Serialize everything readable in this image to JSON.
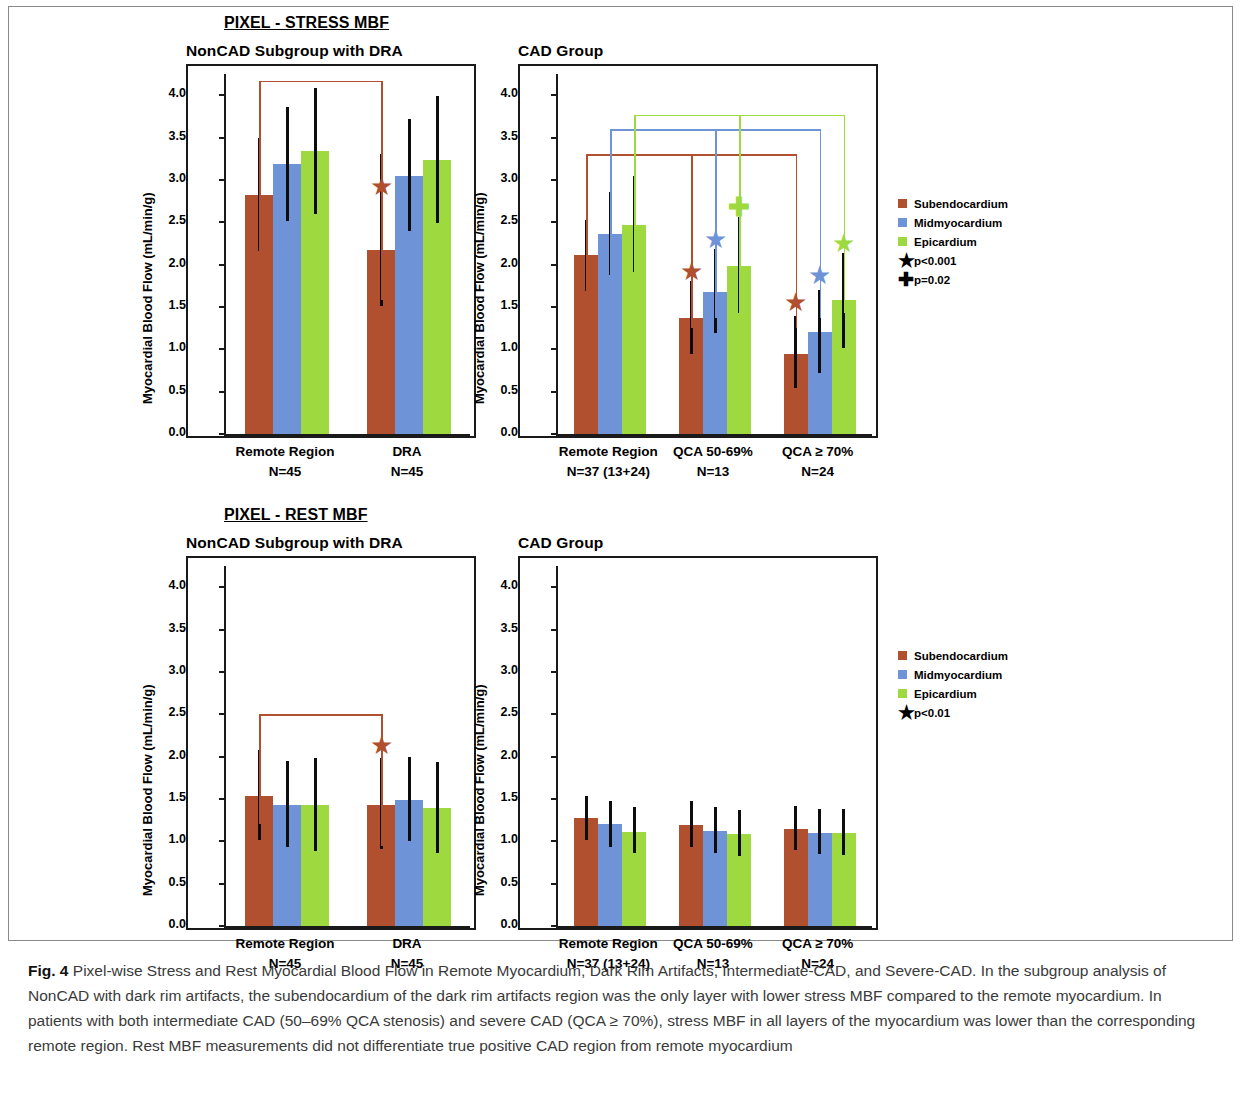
{
  "figure": {
    "sections": [
      {
        "id": "stress",
        "heading": "PIXEL - STRESS MBF"
      },
      {
        "id": "rest",
        "heading": "PIXEL - REST MBF"
      }
    ],
    "caption_label": "Fig. 4",
    "caption_text": " Pixel-wise Stress and Rest Myocardial Blood Flow in Remote Myocardium, Dark Rim Artifacts, Intermediate-CAD, and Severe-CAD. In the subgroup analysis of NonCAD with dark rim artifacts, the subendocardium of the dark rim artifacts region was the only layer with lower stress MBF compared to the remote myocardium. In patients with both intermediate CAD (50–69% QCA stenosis) and severe CAD (QCA ≥ 70%), stress MBF in all layers of the myocardium was lower than the corresponding remote region. Rest MBF measurements did not differentiate true positive CAD region from remote myocardium"
  },
  "colors": {
    "subendocardium": "#b0502f",
    "midmyocardium": "#6e93d6",
    "epicardium": "#9ed93f",
    "errorbar": "#0d0d0d",
    "axis": "#1a1a1a"
  },
  "legends": {
    "stress": {
      "items": [
        {
          "type": "swatch",
          "color_key": "subendocardium",
          "label": "Subendocardium"
        },
        {
          "type": "swatch",
          "color_key": "midmyocardium",
          "label": "Midmyocardium"
        },
        {
          "type": "swatch",
          "color_key": "epicardium",
          "label": "Epicardium"
        },
        {
          "type": "star",
          "label": "p<0.001"
        },
        {
          "type": "plus",
          "label": "p=0.02"
        }
      ]
    },
    "rest": {
      "items": [
        {
          "type": "swatch",
          "color_key": "subendocardium",
          "label": "Subendocardium"
        },
        {
          "type": "swatch",
          "color_key": "midmyocardium",
          "label": "Midmyocardium"
        },
        {
          "type": "swatch",
          "color_key": "epicardium",
          "label": "Epicardium"
        },
        {
          "type": "star",
          "label": "p<0.01"
        }
      ]
    }
  },
  "chart_data": [
    {
      "id": "stress-noncad",
      "type": "bar",
      "title": "NonCAD Subgroup with DRA",
      "section": "PIXEL - STRESS MBF",
      "ylabel": "Myocardial Blood Flow (mL/min/g)",
      "xlabel": "",
      "ylim": [
        0.0,
        4.25
      ],
      "yticks": [
        "0.0",
        "0.5",
        "1.0",
        "1.5",
        "2.0",
        "2.5",
        "3.0",
        "3.5",
        "4.0"
      ],
      "grid": false,
      "categories": [
        "Remote Region",
        "DRA"
      ],
      "category_n": [
        "N=45",
        "N=45"
      ],
      "series": [
        {
          "name": "Subendocardium",
          "values": [
            2.82,
            2.17
          ],
          "err_low": [
            2.16,
            1.51
          ],
          "err_high": [
            3.49,
            3.31
          ]
        },
        {
          "name": "Midmyocardium",
          "values": [
            3.19,
            3.05
          ],
          "err_low": [
            2.52,
            2.4
          ],
          "err_high": [
            3.86,
            3.72
          ]
        },
        {
          "name": "Epicardium",
          "values": [
            3.34,
            3.23
          ],
          "err_low": [
            2.6,
            2.49
          ],
          "err_high": [
            4.09,
            3.99
          ]
        }
      ],
      "annotations": [
        {
          "kind": "star",
          "series": "Subendocardium",
          "category": "DRA",
          "y": 2.93,
          "color_key": "subendocardium"
        }
      ],
      "brackets": [
        {
          "color_key": "subendocardium",
          "y": 4.17,
          "from": "Remote Region",
          "to": "DRA",
          "series": "Subendocardium"
        }
      ]
    },
    {
      "id": "stress-cad",
      "type": "bar",
      "title": "CAD Group",
      "section": "PIXEL - STRESS MBF",
      "ylabel": "Myocardial Blood Flow (mL/min/g)",
      "xlabel": "",
      "ylim": [
        0.0,
        4.25
      ],
      "yticks": [
        "0.0",
        "0.5",
        "1.0",
        "1.5",
        "2.0",
        "2.5",
        "3.0",
        "3.5",
        "4.0"
      ],
      "grid": false,
      "categories": [
        "Remote Region",
        "QCA 50-69%",
        "QCA ≥ 70%"
      ],
      "category_n": [
        "N=37 (13+24)",
        "N=13",
        "N=24"
      ],
      "series": [
        {
          "name": "Subendocardium",
          "values": [
            2.11,
            1.37,
            0.95
          ],
          "err_low": [
            1.69,
            0.94,
            0.54
          ],
          "err_high": [
            2.53,
            1.81,
            1.39
          ]
        },
        {
          "name": "Midmyocardium",
          "values": [
            2.36,
            1.68,
            1.21
          ],
          "err_low": [
            1.88,
            1.19,
            0.72
          ],
          "err_high": [
            2.86,
            2.18,
            1.7
          ]
        },
        {
          "name": "Epicardium",
          "values": [
            2.47,
            1.98,
            1.58
          ],
          "err_low": [
            1.91,
            1.43,
            1.02
          ],
          "err_high": [
            3.05,
            2.56,
            2.14
          ]
        }
      ],
      "annotations": [
        {
          "kind": "star",
          "series": "Subendocardium",
          "category": "QCA 50-69%",
          "y": 1.92,
          "color_key": "subendocardium"
        },
        {
          "kind": "star",
          "series": "Midmyocardium",
          "category": "QCA 50-69%",
          "y": 2.3,
          "color_key": "midmyocardium"
        },
        {
          "kind": "plus",
          "series": "Epicardium",
          "category": "QCA 50-69%",
          "y": 2.68,
          "color_key": "epicardium"
        },
        {
          "kind": "star",
          "series": "Subendocardium",
          "category": "QCA ≥ 70%",
          "y": 1.56,
          "color_key": "subendocardium"
        },
        {
          "kind": "star",
          "series": "Midmyocardium",
          "category": "QCA ≥ 70%",
          "y": 1.88,
          "color_key": "midmyocardium"
        },
        {
          "kind": "star",
          "series": "Epicardium",
          "category": "QCA ≥ 70%",
          "y": 2.26,
          "color_key": "epicardium"
        }
      ],
      "brackets": [
        {
          "color_key": "subendocardium",
          "y": 3.3,
          "from": "Remote Region",
          "to": "QCA ≥ 70%",
          "series": "Subendocardium"
        },
        {
          "color_key": "midmyocardium",
          "y": 3.6,
          "from": "Remote Region",
          "to": "QCA ≥ 70%",
          "series": "Midmyocardium"
        },
        {
          "color_key": "epicardium",
          "y": 3.77,
          "from": "Remote Region",
          "to": "QCA ≥ 70%",
          "series": "Epicardium"
        }
      ]
    },
    {
      "id": "rest-noncad",
      "type": "bar",
      "title": "NonCAD Subgroup with DRA",
      "section": "PIXEL - REST MBF",
      "ylabel": "Myocardial Blood Flow (mL/min/g)",
      "xlabel": "",
      "ylim": [
        0.0,
        4.25
      ],
      "yticks": [
        "0.0",
        "0.5",
        "1.0",
        "1.5",
        "2.0",
        "2.5",
        "3.0",
        "3.5",
        "4.0"
      ],
      "grid": false,
      "categories": [
        "Remote Region",
        "DRA"
      ],
      "category_n": [
        "N=45",
        "N=45"
      ],
      "series": [
        {
          "name": "Subendocardium",
          "values": [
            1.54,
            1.43
          ],
          "err_low": [
            1.01,
            0.91
          ],
          "err_high": [
            2.08,
            1.98
          ]
        },
        {
          "name": "Midmyocardium",
          "values": [
            1.43,
            1.49
          ],
          "err_low": [
            0.93,
            1.0
          ],
          "err_high": [
            1.95,
            2.0
          ]
        },
        {
          "name": "Epicardium",
          "values": [
            1.43,
            1.39
          ],
          "err_low": [
            0.89,
            0.86
          ],
          "err_high": [
            1.98,
            1.94
          ]
        }
      ],
      "annotations": [
        {
          "kind": "star",
          "series": "Subendocardium",
          "category": "DRA",
          "y": 2.14,
          "color_key": "subendocardium"
        }
      ],
      "brackets": [
        {
          "color_key": "subendocardium",
          "y": 2.5,
          "from": "Remote Region",
          "to": "DRA",
          "series": "Subendocardium"
        }
      ]
    },
    {
      "id": "rest-cad",
      "type": "bar",
      "title": "CAD Group",
      "section": "PIXEL - REST MBF",
      "ylabel": "Myocardial Blood Flow (mL/min/g)",
      "xlabel": "",
      "ylim": [
        0.0,
        4.25
      ],
      "yticks": [
        "0.0",
        "0.5",
        "1.0",
        "1.5",
        "2.0",
        "2.5",
        "3.0",
        "3.5",
        "4.0"
      ],
      "grid": false,
      "categories": [
        "Remote Region",
        "QCA 50-69%",
        "QCA ≥ 70%"
      ],
      "category_n": [
        "N=37 (13+24)",
        "N=13",
        "N=24"
      ],
      "series": [
        {
          "name": "Subendocardium",
          "values": [
            1.28,
            1.19,
            1.15
          ],
          "err_low": [
            1.02,
            0.93,
            0.9
          ],
          "err_high": [
            1.54,
            1.47,
            1.42
          ]
        },
        {
          "name": "Midmyocardium",
          "values": [
            1.2,
            1.12,
            1.1
          ],
          "err_low": [
            0.93,
            0.86,
            0.85
          ],
          "err_high": [
            1.48,
            1.4,
            1.38
          ]
        },
        {
          "name": "Epicardium",
          "values": [
            1.11,
            1.09,
            1.1
          ],
          "err_low": [
            0.86,
            0.83,
            0.84
          ],
          "err_high": [
            1.4,
            1.37,
            1.38
          ]
        }
      ],
      "annotations": [],
      "brackets": []
    }
  ]
}
